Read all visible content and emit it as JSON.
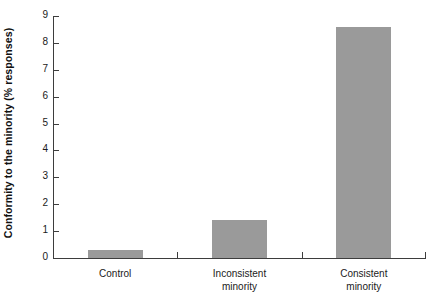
{
  "chart_data": {
    "type": "bar",
    "title": "",
    "xlabel": "",
    "ylabel": "Conformity to the minority (% responses)",
    "categories": [
      "Control",
      "Inconsistent minority",
      "Consistent minority"
    ],
    "category_lines": [
      [
        "Control"
      ],
      [
        "Inconsistent",
        "minority"
      ],
      [
        "Consistent",
        "minority"
      ]
    ],
    "values": [
      0.3,
      1.4,
      8.6
    ],
    "ylim": [
      0,
      9
    ],
    "ytick_labels": [
      "0",
      "1",
      "2",
      "3",
      "4",
      "5",
      "6",
      "7",
      "8",
      "9"
    ],
    "ytick_values": [
      0,
      1,
      2,
      3,
      4,
      5,
      6,
      7,
      8,
      9
    ],
    "grid": false,
    "legend": null,
    "bar_color": "#9a9a9a",
    "axis_color": "#3d3d3d",
    "background": "#ffffff"
  }
}
